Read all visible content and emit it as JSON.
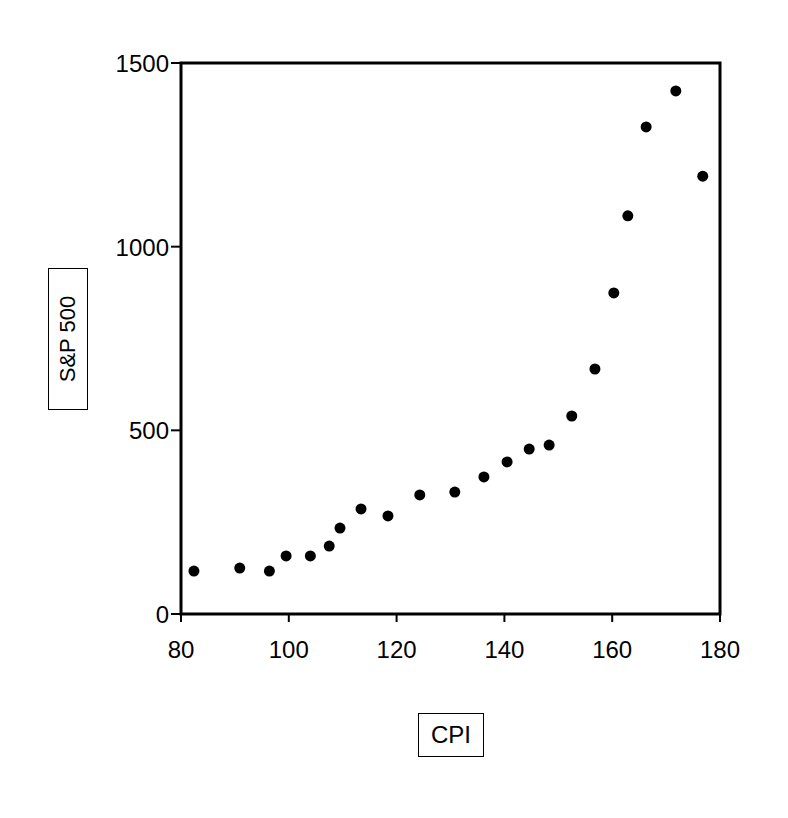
{
  "chart_data": {
    "type": "scatter",
    "title": "",
    "xlabel": "CPI",
    "ylabel": "S&P 500",
    "xlim": [
      80,
      180
    ],
    "ylim": [
      0,
      1500
    ],
    "xticks": [
      80,
      100,
      120,
      140,
      160,
      180
    ],
    "yticks": [
      0,
      500,
      1000,
      1500
    ],
    "grid": false,
    "legend": null,
    "marker_color": "#000000",
    "series": [
      {
        "name": "S&P 500 vs CPI",
        "points": [
          {
            "x": 82.4,
            "y": 117
          },
          {
            "x": 90.9,
            "y": 125
          },
          {
            "x": 96.4,
            "y": 117
          },
          {
            "x": 99.5,
            "y": 158
          },
          {
            "x": 104.0,
            "y": 158
          },
          {
            "x": 107.5,
            "y": 185
          },
          {
            "x": 109.5,
            "y": 234
          },
          {
            "x": 113.4,
            "y": 286
          },
          {
            "x": 118.4,
            "y": 267
          },
          {
            "x": 124.3,
            "y": 324
          },
          {
            "x": 130.8,
            "y": 332
          },
          {
            "x": 136.2,
            "y": 373
          },
          {
            "x": 140.5,
            "y": 414
          },
          {
            "x": 144.6,
            "y": 449
          },
          {
            "x": 148.3,
            "y": 460
          },
          {
            "x": 152.5,
            "y": 539
          },
          {
            "x": 156.8,
            "y": 667
          },
          {
            "x": 160.3,
            "y": 874
          },
          {
            "x": 162.9,
            "y": 1084
          },
          {
            "x": 166.3,
            "y": 1326
          },
          {
            "x": 171.8,
            "y": 1424
          },
          {
            "x": 176.8,
            "y": 1192
          }
        ]
      }
    ]
  }
}
